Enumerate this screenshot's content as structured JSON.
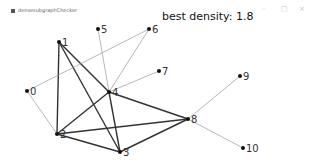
{
  "window": {
    "title": "densesubgraphChecker",
    "controls": {
      "minimize": "–",
      "maximize": "□",
      "close": "×"
    }
  },
  "status": {
    "best_density_label": "best density: 1.8"
  },
  "graph": {
    "nodes": [
      {
        "id": "0",
        "x": 27,
        "y": 91
      },
      {
        "id": "1",
        "x": 59,
        "y": 42
      },
      {
        "id": "2",
        "x": 57,
        "y": 134
      },
      {
        "id": "3",
        "x": 120,
        "y": 152
      },
      {
        "id": "4",
        "x": 109,
        "y": 92
      },
      {
        "id": "5",
        "x": 98,
        "y": 29
      },
      {
        "id": "6",
        "x": 149,
        "y": 29
      },
      {
        "id": "7",
        "x": 159,
        "y": 71
      },
      {
        "id": "8",
        "x": 188,
        "y": 119
      },
      {
        "id": "9",
        "x": 240,
        "y": 76
      },
      {
        "id": "10",
        "x": 243,
        "y": 148
      }
    ],
    "edges": [
      {
        "from": "1",
        "to": "2",
        "dense": true
      },
      {
        "from": "1",
        "to": "3",
        "dense": true
      },
      {
        "from": "1",
        "to": "4",
        "dense": true
      },
      {
        "from": "2",
        "to": "4",
        "dense": true
      },
      {
        "from": "2",
        "to": "3",
        "dense": true
      },
      {
        "from": "2",
        "to": "8",
        "dense": true
      },
      {
        "from": "3",
        "to": "4",
        "dense": true
      },
      {
        "from": "3",
        "to": "8",
        "dense": true
      },
      {
        "from": "4",
        "to": "8",
        "dense": true
      },
      {
        "from": "0",
        "to": "6",
        "dense": false
      },
      {
        "from": "0",
        "to": "2",
        "dense": false
      },
      {
        "from": "4",
        "to": "5",
        "dense": false
      },
      {
        "from": "4",
        "to": "6",
        "dense": false
      },
      {
        "from": "4",
        "to": "7",
        "dense": false
      },
      {
        "from": "8",
        "to": "9",
        "dense": false
      },
      {
        "from": "8",
        "to": "10",
        "dense": false
      }
    ],
    "colors": {
      "dense_edge": "#333333",
      "sparse_edge": "#999999",
      "node": "#111111"
    }
  }
}
